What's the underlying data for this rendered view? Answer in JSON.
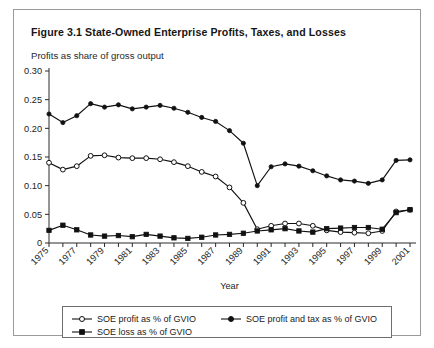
{
  "figure": {
    "title": "Figure 3.1  State-Owned Enterprise Profits, Taxes, and Losses",
    "subtitle": "Profits as share of gross output"
  },
  "axes": {
    "x_title": "Year",
    "y_ticklabels": [
      "0",
      "0.05",
      "0.10",
      "0.15",
      "0.20",
      "0.25",
      "0.30"
    ],
    "x_ticklabels": [
      "1975",
      "1977",
      "1979",
      "1981",
      "1983",
      "1985",
      "1987",
      "1989",
      "1991",
      "1993",
      "1995",
      "1997",
      "1999",
      "2001"
    ]
  },
  "legend": {
    "entries": [
      {
        "label": "SOE profit as % of GVIO",
        "marker": "open-circle"
      },
      {
        "label": "SOE profit and tax as % of GVIO",
        "marker": "filled-circle"
      },
      {
        "label": "SOE loss as % of GVIO",
        "marker": "filled-square"
      }
    ]
  },
  "chart_data": {
    "type": "line",
    "title": "Figure 3.1  State-Owned Enterprise Profits, Taxes, and Losses",
    "subtitle": "Profits as share of gross output",
    "xlabel": "Year",
    "ylabel": "Profits as share of gross output",
    "xlim": [
      1975,
      2001
    ],
    "ylim": [
      0,
      0.3
    ],
    "yticks": [
      0,
      0.05,
      0.1,
      0.15,
      0.2,
      0.25,
      0.3
    ],
    "xticks": [
      1975,
      1977,
      1979,
      1981,
      1983,
      1985,
      1987,
      1989,
      1991,
      1993,
      1995,
      1997,
      1999,
      2001
    ],
    "grid": false,
    "legend_position": "bottom",
    "x": [
      1975,
      1976,
      1977,
      1978,
      1979,
      1980,
      1981,
      1982,
      1983,
      1984,
      1985,
      1986,
      1987,
      1988,
      1989,
      1990,
      1991,
      1992,
      1993,
      1994,
      1995,
      1996,
      1997,
      1998,
      1999,
      2000,
      2001
    ],
    "series": [
      {
        "name": "SOE profit and tax as % of GVIO",
        "marker": "filled-circle",
        "values": [
          0.225,
          0.21,
          0.222,
          0.243,
          0.237,
          0.241,
          0.234,
          0.237,
          0.24,
          0.235,
          0.228,
          0.219,
          0.212,
          0.196,
          0.174,
          0.1,
          0.133,
          0.138,
          0.134,
          0.126,
          0.117,
          0.11,
          0.108,
          0.104,
          0.11,
          0.144,
          0.145
        ]
      },
      {
        "name": "SOE profit as % of GVIO",
        "marker": "open-circle",
        "values": [
          0.14,
          0.128,
          0.134,
          0.152,
          0.153,
          0.149,
          0.148,
          0.148,
          0.146,
          0.141,
          0.134,
          0.124,
          0.116,
          0.097,
          0.07,
          0.024,
          0.03,
          0.034,
          0.034,
          0.03,
          0.022,
          0.019,
          0.018,
          0.017,
          0.021,
          0.055,
          0.058
        ]
      },
      {
        "name": "SOE loss as % of GVIO",
        "marker": "filled-square",
        "values": [
          0.022,
          0.031,
          0.023,
          0.014,
          0.012,
          0.013,
          0.011,
          0.015,
          0.012,
          0.009,
          0.008,
          0.01,
          0.014,
          0.015,
          0.017,
          0.021,
          0.023,
          0.025,
          0.021,
          0.019,
          0.025,
          0.026,
          0.027,
          0.027,
          0.024,
          0.053,
          0.058
        ]
      }
    ]
  }
}
